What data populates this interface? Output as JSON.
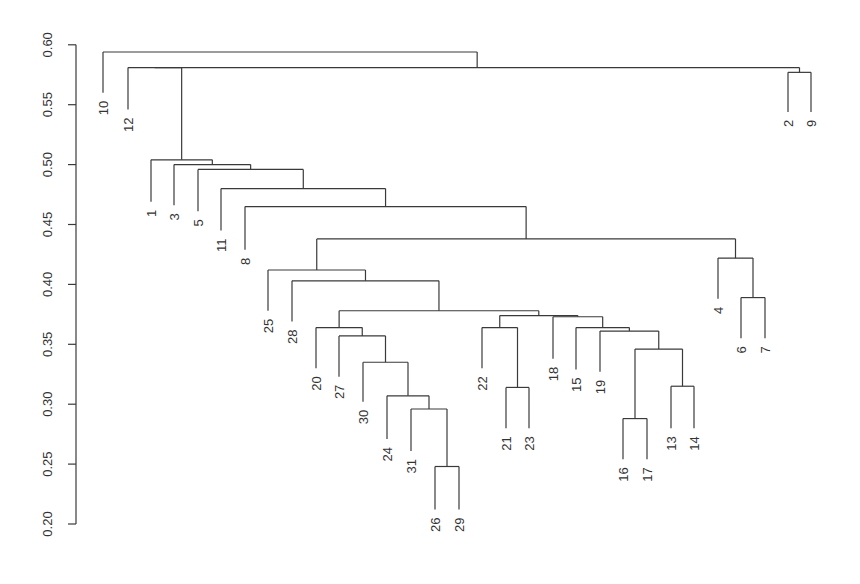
{
  "chart_data": {
    "type": "dendrogram",
    "title": "",
    "xlabel": "",
    "ylabel": "",
    "ylim": [
      0.2,
      0.6
    ],
    "yticks": [
      "0.20",
      "0.25",
      "0.30",
      "0.35",
      "0.40",
      "0.45",
      "0.50",
      "0.55",
      "0.60"
    ],
    "grid": false,
    "legend": null,
    "leaf_order": [
      10,
      12,
      1,
      3,
      5,
      11,
      8,
      25,
      28,
      20,
      27,
      30,
      24,
      31,
      26,
      29,
      22,
      21,
      23,
      18,
      15,
      19,
      16,
      17,
      13,
      14,
      4,
      6,
      7,
      2,
      9
    ],
    "leaves": [
      {
        "label": "10",
        "x": 103,
        "bottom": 0.56
      },
      {
        "label": "12",
        "x": 128,
        "bottom": 0.546
      },
      {
        "label": "1",
        "x": 151,
        "bottom": 0.469
      },
      {
        "label": "3",
        "x": 174,
        "bottom": 0.466
      },
      {
        "label": "5",
        "x": 198,
        "bottom": 0.461
      },
      {
        "label": "11",
        "x": 221,
        "bottom": 0.445
      },
      {
        "label": "8",
        "x": 245,
        "bottom": 0.429
      },
      {
        "label": "25",
        "x": 268,
        "bottom": 0.378
      },
      {
        "label": "28",
        "x": 292,
        "bottom": 0.369
      },
      {
        "label": "20",
        "x": 316,
        "bottom": 0.33
      },
      {
        "label": "27",
        "x": 339,
        "bottom": 0.323
      },
      {
        "label": "30",
        "x": 363,
        "bottom": 0.302
      },
      {
        "label": "24",
        "x": 387,
        "bottom": 0.271
      },
      {
        "label": "31",
        "x": 411,
        "bottom": 0.261
      },
      {
        "label": "26",
        "x": 435,
        "bottom": 0.212
      },
      {
        "label": "29",
        "x": 459,
        "bottom": 0.212
      },
      {
        "label": "22",
        "x": 482,
        "bottom": 0.33
      },
      {
        "label": "21",
        "x": 506,
        "bottom": 0.28
      },
      {
        "label": "23",
        "x": 529,
        "bottom": 0.28
      },
      {
        "label": "18",
        "x": 553,
        "bottom": 0.338
      },
      {
        "label": "15",
        "x": 576,
        "bottom": 0.329
      },
      {
        "label": "19",
        "x": 600,
        "bottom": 0.327
      },
      {
        "label": "16",
        "x": 623,
        "bottom": 0.254
      },
      {
        "label": "17",
        "x": 647,
        "bottom": 0.254
      },
      {
        "label": "13",
        "x": 671,
        "bottom": 0.28
      },
      {
        "label": "14",
        "x": 694,
        "bottom": 0.28
      },
      {
        "label": "4",
        "x": 718,
        "bottom": 0.388
      },
      {
        "label": "6",
        "x": 741,
        "bottom": 0.355
      },
      {
        "label": "7",
        "x": 765,
        "bottom": 0.355
      },
      {
        "label": "2",
        "x": 788,
        "bottom": 0.544
      },
      {
        "label": "9",
        "x": 811,
        "bottom": 0.544
      }
    ],
    "merges": [
      {
        "id": "m26_29",
        "left": "L:26",
        "right": "L:29",
        "height": 0.248
      },
      {
        "id": "m31",
        "left": "L:31",
        "right": "N:m26_29",
        "height": 0.296
      },
      {
        "id": "m24",
        "left": "L:24",
        "right": "N:m31",
        "height": 0.307
      },
      {
        "id": "m30",
        "left": "L:30",
        "right": "N:m24",
        "height": 0.335
      },
      {
        "id": "m27",
        "left": "L:27",
        "right": "N:m30",
        "height": 0.357
      },
      {
        "id": "m20",
        "left": "L:20",
        "right": "N:m27",
        "height": 0.364
      },
      {
        "id": "m21_23",
        "left": "L:21",
        "right": "L:23",
        "height": 0.314
      },
      {
        "id": "m22",
        "left": "L:22",
        "right": "N:m21_23",
        "height": 0.364
      },
      {
        "id": "m16_17",
        "left": "L:16",
        "right": "L:17",
        "height": 0.288
      },
      {
        "id": "m13_14",
        "left": "L:13",
        "right": "L:14",
        "height": 0.315
      },
      {
        "id": "m1617_1314",
        "left": "N:m16_17",
        "right": "N:m13_14",
        "height": 0.346
      },
      {
        "id": "m19",
        "left": "L:19",
        "right": "N:m1617_1314",
        "height": 0.361
      },
      {
        "id": "m15",
        "left": "L:15",
        "right": "N:m19",
        "height": 0.364
      },
      {
        "id": "m18",
        "left": "L:18",
        "right": "N:m15",
        "height": 0.373
      },
      {
        "id": "m22_18",
        "left": "N:m22",
        "right": "N:m18",
        "height": 0.374
      },
      {
        "id": "m20_22",
        "left": "N:m20",
        "right": "N:m22_18",
        "height": 0.378
      },
      {
        "id": "m28",
        "left": "L:28",
        "right": "N:m20_22",
        "height": 0.403
      },
      {
        "id": "m25",
        "left": "L:25",
        "right": "N:m28",
        "height": 0.412
      },
      {
        "id": "m6_7",
        "left": "L:6",
        "right": "L:7",
        "height": 0.389
      },
      {
        "id": "m4",
        "left": "L:4",
        "right": "N:m6_7",
        "height": 0.422
      },
      {
        "id": "m25_4",
        "left": "N:m25",
        "right": "N:m4",
        "height": 0.438
      },
      {
        "id": "m8",
        "left": "L:8",
        "right": "N:m25_4",
        "height": 0.465
      },
      {
        "id": "m11",
        "left": "L:11",
        "right": "N:m8",
        "height": 0.48
      },
      {
        "id": "m5",
        "left": "L:5",
        "right": "N:m11",
        "height": 0.496
      },
      {
        "id": "m3",
        "left": "L:3",
        "right": "N:m5",
        "height": 0.5
      },
      {
        "id": "m1",
        "left": "L:1",
        "right": "N:m3",
        "height": 0.504
      },
      {
        "id": "m2_9",
        "left": "L:2",
        "right": "L:9",
        "height": 0.577
      },
      {
        "id": "m12",
        "left": "L:12",
        "right": "N:m1",
        "height": 0.581,
        "note": "arm of 12-cluster drawn to 2/9 cluster"
      },
      {
        "id": "m12_29",
        "left": "N:m12",
        "right": "N:m2_9",
        "height": 0.581
      },
      {
        "id": "root",
        "left": "L:10",
        "right": "N:m12_29",
        "height": 0.594
      }
    ],
    "layout": {
      "axis_x": 76,
      "y_at_0_20": 524,
      "px_per_unit": 1198,
      "label_gap": 8
    }
  },
  "axis": {
    "ticks": [
      {
        "label": "0.20",
        "value": 0.2
      },
      {
        "label": "0.25",
        "value": 0.25
      },
      {
        "label": "0.30",
        "value": 0.3
      },
      {
        "label": "0.35",
        "value": 0.35
      },
      {
        "label": "0.40",
        "value": 0.4
      },
      {
        "label": "0.45",
        "value": 0.45
      },
      {
        "label": "0.50",
        "value": 0.5
      },
      {
        "label": "0.55",
        "value": 0.55
      },
      {
        "label": "0.60",
        "value": 0.6
      }
    ]
  }
}
